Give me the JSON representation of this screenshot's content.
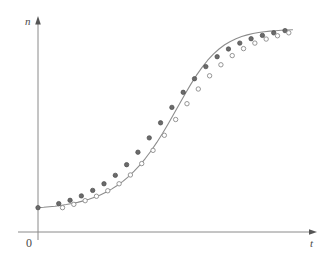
{
  "figure": {
    "background_color": "#ffffff",
    "width": 331,
    "height": 269
  },
  "axes": {
    "y_axis_label": "n",
    "x_axis_label": "t",
    "origin_label": "0",
    "axis_color": "#8a8a8a",
    "label_color": "#4a4a4a",
    "y_axis_x_px": 38,
    "y_axis_top_px": 22,
    "y_axis_bottom_px": 240,
    "x_axis_y_px": 232,
    "x_axis_left_px": 18,
    "x_axis_right_px": 312,
    "arrowheads": "both-axes-outward"
  },
  "style": {
    "curve_color": "#8c8c8c",
    "curve_width_px": 1.1,
    "filled_marker_color": "#6b6b6b",
    "filled_marker_edge": "#4a4a4a",
    "open_marker_edge": "#8a8a8a",
    "open_marker_fill": "#ffffff",
    "marker_radius_px": 2.2,
    "tick_color": "#8a8a8a"
  },
  "chart_data": {
    "type": "line",
    "title": "",
    "subtitle": "",
    "xlabel": "t",
    "ylabel": "n",
    "grid": false,
    "legend": false,
    "legend_position": "none",
    "axis_ticks": "none",
    "xlim": [
      0,
      28
    ],
    "ylim": [
      0,
      26
    ],
    "series": [
      {
        "name": "fitted-logistic-curve",
        "marker": "none",
        "x": [
          0.0,
          0.6,
          1.2,
          1.8,
          2.4,
          3.0,
          3.6,
          4.2,
          4.8,
          5.4,
          6.0,
          6.6,
          7.2,
          7.8,
          8.4,
          9.0,
          9.6,
          10.2,
          10.8,
          11.4,
          12.0,
          12.6,
          13.2,
          13.8,
          14.4,
          15.0,
          15.6,
          16.2,
          16.8,
          17.4,
          18.0,
          18.6,
          19.2,
          19.8,
          20.4,
          21.0,
          21.6,
          22.2,
          22.8,
          23.4,
          24.0,
          24.6,
          25.2,
          25.8,
          26.4,
          27.0
        ],
        "y": [
          1.0,
          1.05,
          1.12,
          1.2,
          1.3,
          1.42,
          1.56,
          1.72,
          1.92,
          2.15,
          2.42,
          2.73,
          3.1,
          3.52,
          4.01,
          4.58,
          5.22,
          5.96,
          6.79,
          7.72,
          8.75,
          9.88,
          11.1,
          12.4,
          13.75,
          15.12,
          16.48,
          17.78,
          19.0,
          20.1,
          21.07,
          21.9,
          22.6,
          23.17,
          23.63,
          24.0,
          24.29,
          24.52,
          24.7,
          24.84,
          24.95,
          25.03,
          25.09,
          25.14,
          25.18,
          25.21
        ]
      },
      {
        "name": "observed-upper-filled-circles",
        "marker": "filled-circle",
        "x": [
          0.0,
          2.2,
          3.4,
          4.6,
          5.8,
          7.0,
          8.2,
          9.4,
          10.6,
          11.8,
          13.0,
          14.2,
          15.4,
          16.6,
          17.8,
          19.0,
          20.2,
          21.4,
          22.6,
          23.8,
          25.0,
          26.2
        ],
        "y": [
          1.0,
          1.55,
          2.0,
          2.6,
          3.35,
          4.25,
          5.4,
          6.85,
          8.55,
          10.5,
          12.55,
          14.65,
          16.7,
          18.55,
          20.2,
          21.55,
          22.6,
          23.4,
          24.0,
          24.45,
          24.8,
          25.1
        ]
      },
      {
        "name": "observed-lower-open-circles",
        "marker": "open-circle",
        "x": [
          2.6,
          3.8,
          5.0,
          6.2,
          7.4,
          8.6,
          9.8,
          11.0,
          12.2,
          13.4,
          14.6,
          15.8,
          17.0,
          18.2,
          19.4,
          20.6,
          21.8,
          23.0,
          24.2,
          25.4,
          26.6
        ],
        "y": [
          1.0,
          1.45,
          1.95,
          2.55,
          3.3,
          4.25,
          5.45,
          7.0,
          8.8,
          10.85,
          13.0,
          15.15,
          17.15,
          18.95,
          20.45,
          21.7,
          22.65,
          23.4,
          23.95,
          24.4,
          24.8
        ]
      }
    ]
  }
}
